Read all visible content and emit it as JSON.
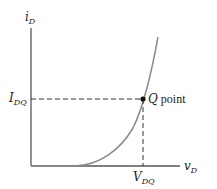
{
  "diagram": {
    "y_axis": {
      "label_main": "i",
      "label_sub": "D"
    },
    "x_axis": {
      "label_main": "v",
      "label_sub": "D"
    },
    "q_point": {
      "label_italic": "Q",
      "label_rest": " point",
      "current_label_main": "I",
      "current_label_sub": "DQ",
      "voltage_label_main": "V",
      "voltage_label_sub": "DQ"
    },
    "colors": {
      "axis": "#555555",
      "curve": "#888888",
      "dashed": "#333333",
      "point": "#111111"
    }
  }
}
